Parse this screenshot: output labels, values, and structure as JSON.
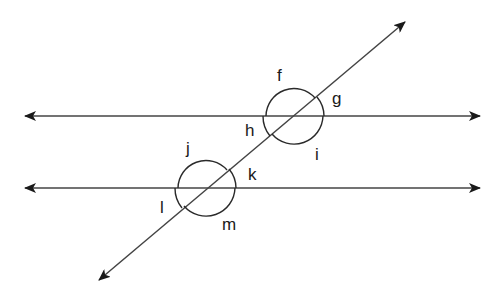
{
  "diagram": {
    "type": "parallel lines cut by a transversal",
    "colors": {
      "line": "#444444",
      "arc": "#2a2a2a",
      "text": "#1a1a1a"
    },
    "lines": [
      {
        "name": "upper-parallel-line",
        "x1": 23,
        "y1": 116,
        "x2": 481,
        "y2": 116
      },
      {
        "name": "lower-parallel-line",
        "x1": 23,
        "y1": 188,
        "x2": 481,
        "y2": 188
      },
      {
        "name": "transversal-line",
        "x1": 98,
        "y1": 281,
        "x2": 406,
        "y2": 21
      }
    ],
    "angle_labels": {
      "f": "f",
      "g": "g",
      "h": "h",
      "i": "i",
      "j": "j",
      "k": "k",
      "l": "l",
      "m": "m"
    }
  }
}
